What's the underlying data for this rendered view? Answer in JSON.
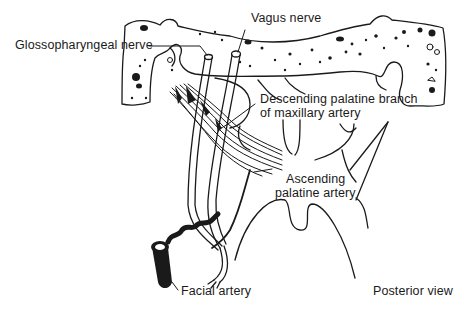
{
  "diagram": {
    "view": "Posterior view",
    "labels": {
      "glossopharyngeal": "Glossopharyngeal nerve",
      "vagus": "Vagus nerve",
      "descending_line1": "Descending palatine branch",
      "descending_line2": "of maxillary artery",
      "ascending_line1": "Ascending",
      "ascending_line2": "palatine artery",
      "facial": "Facial artery",
      "view": "Posterior view"
    },
    "colors": {
      "ink": "#1a1a1a",
      "background": "#ffffff"
    }
  }
}
